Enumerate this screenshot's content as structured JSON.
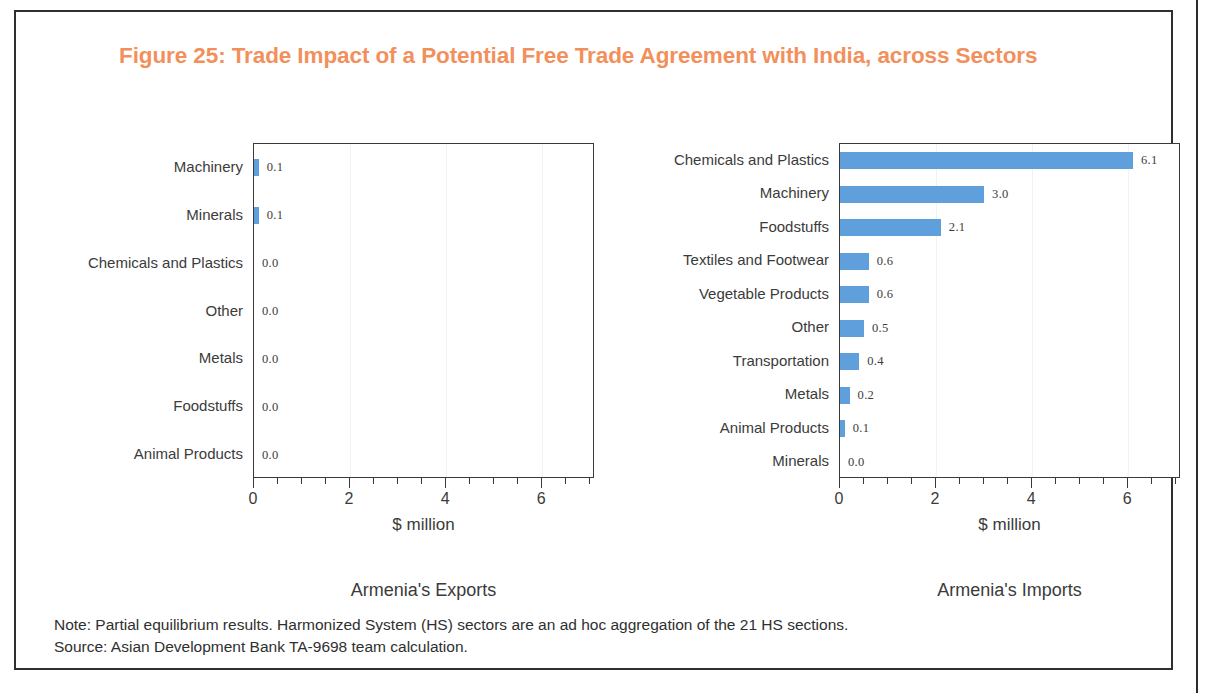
{
  "figure": {
    "title": "Figure 25: Trade Impact of a Potential Free Trade Agreement with India, across Sectors",
    "title_color": "#f2905c",
    "bar_color": "#5f9fdc",
    "notes": {
      "note": "Note: Partial equilibrium results. Harmonized System (HS) sectors are an ad hoc aggregation of the 21 HS sections.",
      "source": "Source: Asian Development Bank TA-9698 team calculation."
    }
  },
  "chart_data": [
    {
      "type": "bar",
      "orientation": "horizontal",
      "title": "Armenia's Exports",
      "xlabel": "$ million",
      "ylabel": "",
      "xlim": [
        0,
        7.1
      ],
      "xticks": [
        0,
        2,
        4,
        6
      ],
      "xtick_labels": [
        "0",
        "2",
        "4",
        "6"
      ],
      "minor_tick_step": 0.5,
      "grid": true,
      "legend": null,
      "categories": [
        "Machinery",
        "Minerals",
        "Chemicals and Plastics",
        "Other",
        "Metals",
        "Foodstuffs",
        "Animal Products"
      ],
      "values": [
        0.1,
        0.1,
        0.0,
        0.0,
        0.0,
        0.0,
        0.0
      ],
      "value_labels": [
        "0.1",
        "0.1",
        "0.0",
        "0.0",
        "0.0",
        "0.0",
        "0.0"
      ]
    },
    {
      "type": "bar",
      "orientation": "horizontal",
      "title": "Armenia's Imports",
      "xlabel": "$ million",
      "ylabel": "",
      "xlim": [
        0,
        7.1
      ],
      "xticks": [
        0,
        2,
        4,
        6
      ],
      "xtick_labels": [
        "0",
        "2",
        "4",
        "6"
      ],
      "minor_tick_step": 0.5,
      "grid": true,
      "legend": null,
      "categories": [
        "Chemicals and Plastics",
        "Machinery",
        "Foodstuffs",
        "Textiles and Footwear",
        "Vegetable Products",
        "Other",
        "Transportation",
        "Metals",
        "Animal Products",
        "Minerals"
      ],
      "values": [
        6.1,
        3.0,
        2.1,
        0.6,
        0.6,
        0.5,
        0.4,
        0.2,
        0.1,
        0.0
      ],
      "value_labels": [
        "6.1",
        "3.0",
        "2.1",
        "0.6",
        "0.6",
        "0.5",
        "0.4",
        "0.2",
        "0.1",
        "0.0"
      ]
    }
  ]
}
